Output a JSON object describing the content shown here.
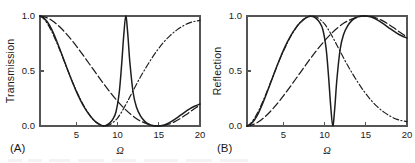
{
  "figure": {
    "background_color": "#ffffff",
    "line_color": "#1d1d1d",
    "axis_color": "#555555",
    "omega_symbol": "Ω"
  },
  "panels": [
    {
      "label": "(A)",
      "ylabel": "Transmission",
      "xlabel": "Ω",
      "ytick_labels": [
        "0.0",
        "0.5",
        "1.0"
      ],
      "xtick_labels": [
        "5",
        "10",
        "15",
        "20"
      ]
    },
    {
      "label": "(B)",
      "ylabel": "Reflection",
      "xlabel": "Ω",
      "ytick_labels": [
        "0.0",
        "0.5",
        "1.0"
      ],
      "xtick_labels": [
        "5",
        "10",
        "15",
        "20"
      ]
    }
  ],
  "chart_data": [
    {
      "type": "line",
      "title": "",
      "panel": "(A)",
      "xlabel": "Ω",
      "ylabel": "Transmission",
      "xlim": [
        0.6,
        20
      ],
      "ylim": [
        0.0,
        1.0
      ],
      "xticks": [
        5,
        10,
        15,
        20
      ],
      "yticks": [
        0.0,
        0.5,
        1.0
      ],
      "grid": false,
      "legend": "none",
      "series": [
        {
          "name": "solid",
          "style": "solid",
          "description": "Transmission with sharp resonance peak at Omega = 11; broad minima near Omega = 8.3 and Omega = 15",
          "x": [
            0.6,
            1.0,
            1.5,
            2.0,
            2.5,
            3.0,
            3.5,
            4.0,
            4.5,
            5.0,
            5.5,
            6.0,
            6.5,
            7.0,
            7.5,
            8.0,
            8.3,
            8.6,
            9.0,
            9.4,
            9.8,
            10.2,
            10.5,
            10.75,
            11.0,
            11.25,
            11.5,
            11.9,
            12.3,
            12.8,
            13.3,
            13.8,
            14.3,
            14.7,
            15.0,
            15.4,
            15.9,
            16.5,
            17.2,
            18.0,
            18.8,
            19.4,
            20.0
          ],
          "values": [
            1.0,
            0.985,
            0.945,
            0.88,
            0.795,
            0.7,
            0.6,
            0.5,
            0.404,
            0.315,
            0.236,
            0.167,
            0.11,
            0.064,
            0.03,
            0.008,
            0.002,
            0.006,
            0.024,
            0.058,
            0.125,
            0.3,
            0.56,
            0.82,
            1.0,
            0.83,
            0.575,
            0.3,
            0.17,
            0.09,
            0.042,
            0.016,
            0.003,
            0.0,
            0.0,
            0.004,
            0.016,
            0.04,
            0.074,
            0.118,
            0.158,
            0.182,
            0.2
          ]
        },
        {
          "name": "dash-dot",
          "style": "dashdot",
          "description": "Monotone decay to zero near Omega = 8.5 then rise toward 0.95 at Omega = 20",
          "x": [
            0.6,
            1.0,
            1.5,
            2.0,
            2.5,
            3.0,
            3.5,
            4.0,
            4.5,
            5.0,
            5.5,
            6.0,
            6.5,
            7.0,
            7.5,
            8.0,
            8.5,
            9.0,
            9.5,
            10.0,
            10.6,
            11.2,
            11.8,
            12.5,
            13.2,
            14.0,
            14.8,
            15.6,
            16.4,
            17.2,
            18.0,
            18.8,
            19.4,
            20.0
          ],
          "values": [
            1.0,
            0.978,
            0.93,
            0.862,
            0.78,
            0.69,
            0.596,
            0.5,
            0.408,
            0.322,
            0.243,
            0.172,
            0.112,
            0.062,
            0.027,
            0.007,
            0.0,
            0.01,
            0.035,
            0.072,
            0.14,
            0.222,
            0.308,
            0.408,
            0.5,
            0.598,
            0.686,
            0.762,
            0.824,
            0.874,
            0.912,
            0.94,
            0.952,
            0.96
          ]
        },
        {
          "name": "long-dash",
          "style": "longdash",
          "description": "Broad slow decay reaching zero near Omega = 15 then rise to about 0.19 at Omega = 20",
          "x": [
            0.6,
            1.0,
            1.5,
            2.0,
            2.6,
            3.2,
            3.8,
            4.5,
            5.2,
            6.0,
            6.8,
            7.6,
            8.4,
            9.2,
            10.0,
            10.8,
            11.6,
            12.4,
            13.0,
            13.6,
            14.2,
            14.7,
            15.1,
            15.6,
            16.2,
            16.9,
            17.6,
            18.3,
            19.0,
            19.5,
            20.0
          ],
          "values": [
            1.0,
            0.995,
            0.982,
            0.962,
            0.928,
            0.886,
            0.838,
            0.776,
            0.708,
            0.626,
            0.542,
            0.458,
            0.376,
            0.298,
            0.226,
            0.162,
            0.107,
            0.062,
            0.038,
            0.02,
            0.007,
            0.001,
            0.0,
            0.004,
            0.016,
            0.038,
            0.068,
            0.103,
            0.14,
            0.166,
            0.19
          ]
        }
      ]
    },
    {
      "type": "line",
      "title": "",
      "panel": "(B)",
      "xlabel": "Ω",
      "ylabel": "Reflection",
      "xlim": [
        0.6,
        20
      ],
      "ylim": [
        0.0,
        1.0
      ],
      "xticks": [
        5,
        10,
        15,
        20
      ],
      "yticks": [
        0.0,
        0.5,
        1.0
      ],
      "grid": false,
      "legend": "none",
      "series": [
        {
          "name": "solid",
          "style": "solid",
          "description": "Reflection complement of panel A: rises to 1.0 near Omega = 8.3, sharp notch to 0.0 at Omega = 11, back to 1.0 near Omega = 15",
          "x": [
            0.6,
            1.0,
            1.5,
            2.0,
            2.5,
            3.0,
            3.5,
            4.0,
            4.5,
            5.0,
            5.5,
            6.0,
            6.5,
            7.0,
            7.5,
            8.0,
            8.3,
            8.6,
            9.0,
            9.4,
            9.8,
            10.2,
            10.5,
            10.75,
            11.0,
            11.25,
            11.5,
            11.9,
            12.3,
            12.8,
            13.3,
            13.8,
            14.3,
            14.7,
            15.0,
            15.4,
            15.9,
            16.5,
            17.2,
            18.0,
            18.8,
            19.4,
            20.0
          ],
          "values": [
            0.0,
            0.015,
            0.055,
            0.12,
            0.205,
            0.3,
            0.4,
            0.5,
            0.596,
            0.685,
            0.764,
            0.833,
            0.89,
            0.936,
            0.97,
            0.992,
            0.998,
            0.994,
            0.976,
            0.942,
            0.875,
            0.7,
            0.44,
            0.18,
            0.0,
            0.17,
            0.425,
            0.7,
            0.83,
            0.91,
            0.958,
            0.984,
            0.997,
            1.0,
            1.0,
            0.996,
            0.984,
            0.96,
            0.926,
            0.882,
            0.842,
            0.818,
            0.8
          ]
        },
        {
          "name": "dash-dot",
          "style": "dashdot",
          "description": "Rises to 1.0 near Omega = 8.5 then decays to about 0.10 at Omega = 20",
          "x": [
            0.6,
            1.0,
            1.5,
            2.0,
            2.5,
            3.0,
            3.5,
            4.0,
            4.5,
            5.0,
            5.5,
            6.0,
            6.5,
            7.0,
            7.5,
            8.0,
            8.5,
            9.0,
            9.5,
            10.0,
            10.6,
            11.2,
            11.8,
            12.5,
            13.2,
            14.0,
            14.8,
            15.6,
            16.4,
            17.2,
            18.0,
            18.8,
            19.4,
            20.0
          ],
          "values": [
            0.0,
            0.022,
            0.07,
            0.138,
            0.22,
            0.31,
            0.404,
            0.5,
            0.592,
            0.678,
            0.757,
            0.828,
            0.888,
            0.938,
            0.973,
            0.993,
            1.0,
            0.99,
            0.965,
            0.928,
            0.86,
            0.778,
            0.692,
            0.592,
            0.5,
            0.402,
            0.314,
            0.238,
            0.176,
            0.126,
            0.088,
            0.06,
            0.048,
            0.04
          ]
        },
        {
          "name": "long-dash",
          "style": "longdash",
          "description": "Slow broad rise reaching 1.0 near Omega = 15 then gentle decay to about 0.81 at Omega = 20",
          "x": [
            0.6,
            1.0,
            1.5,
            2.0,
            2.6,
            3.2,
            3.8,
            4.5,
            5.2,
            6.0,
            6.8,
            7.6,
            8.4,
            9.2,
            10.0,
            10.8,
            11.6,
            12.4,
            13.0,
            13.6,
            14.2,
            14.7,
            15.1,
            15.6,
            16.2,
            16.9,
            17.6,
            18.3,
            19.0,
            19.5,
            20.0
          ],
          "values": [
            0.0,
            0.005,
            0.018,
            0.038,
            0.072,
            0.114,
            0.162,
            0.224,
            0.292,
            0.374,
            0.458,
            0.542,
            0.624,
            0.702,
            0.774,
            0.838,
            0.893,
            0.938,
            0.962,
            0.98,
            0.993,
            0.999,
            1.0,
            0.996,
            0.984,
            0.962,
            0.932,
            0.897,
            0.86,
            0.834,
            0.81
          ]
        }
      ]
    }
  ]
}
